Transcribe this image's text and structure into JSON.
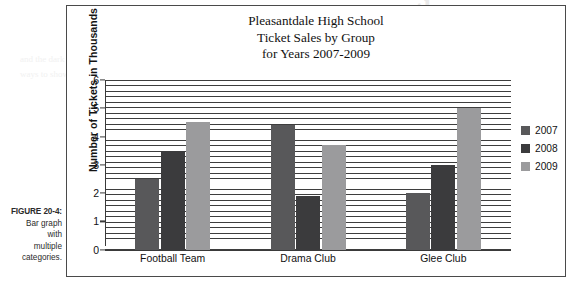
{
  "caption": {
    "label": "FIGURE 20-4:",
    "lines": [
      "Bar graph",
      "with",
      "multiple",
      "categories."
    ]
  },
  "bleed": {
    "heading": "uung the",
    "body": "and the dark lines are the most common\nways to show that a group uses a bar"
  },
  "chart_data": {
    "type": "bar",
    "title": "Pleasantdale High School\nTicket Sales by Group\nfor Years 2007-2009",
    "title_lines": [
      "Pleasantdale High School",
      "Ticket Sales by Group",
      "for Years 2007-2009"
    ],
    "xlabel": "",
    "ylabel": "Number of Tickets in Thousands",
    "categories": [
      "Football Team",
      "Drama Club",
      "Glee Club"
    ],
    "series": [
      {
        "name": "2007",
        "color": "#58585a",
        "values": [
          2.5,
          4.4,
          2.0
        ]
      },
      {
        "name": "2008",
        "color": "#3b3b3d",
        "values": [
          3.5,
          1.9,
          3.0
        ]
      },
      {
        "name": "2009",
        "color": "#9b9b9d",
        "values": [
          4.5,
          3.7,
          5.0
        ]
      }
    ],
    "ylim": [
      0,
      6
    ],
    "yticks": [
      0,
      1,
      2,
      3,
      4,
      5,
      6
    ],
    "ytick_labels": [
      "0",
      "1",
      "2",
      "3",
      "4",
      "5",
      "6"
    ],
    "grid": true,
    "grid_style": "dense-horizontal-hatch",
    "grid_interval": 0.2,
    "legend_position": "right",
    "background": "#ffffff",
    "axis_color": "#3a3a3a"
  }
}
